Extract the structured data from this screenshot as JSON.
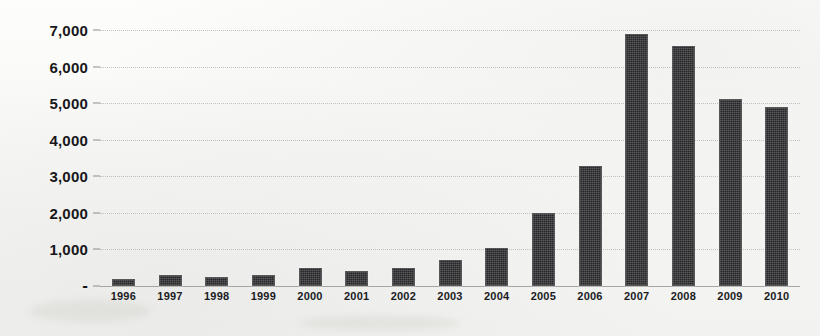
{
  "chart_data": {
    "type": "bar",
    "title": "",
    "subtitle": "",
    "xlabel": "",
    "ylabel": "",
    "categories": [
      "1996",
      "1997",
      "1998",
      "1999",
      "2000",
      "2001",
      "2002",
      "2003",
      "2004",
      "2005",
      "2006",
      "2007",
      "2008",
      "2009",
      "2010"
    ],
    "values": [
      200,
      300,
      250,
      300,
      500,
      420,
      490,
      700,
      1030,
      2000,
      3280,
      6900,
      6550,
      5120,
      4900
    ],
    "series": [
      {
        "name": "",
        "values": [
          200,
          300,
          250,
          300,
          500,
          420,
          490,
          700,
          1030,
          2000,
          3280,
          6900,
          6550,
          5120,
          4900
        ]
      }
    ],
    "ylim": [
      0,
      7000
    ],
    "y_ticks": [
      0,
      1000,
      2000,
      3000,
      4000,
      5000,
      6000,
      7000
    ],
    "y_tick_labels": [
      "-",
      "1,000",
      "2,000",
      "3,000",
      "4,000",
      "5,000",
      "6,000",
      "7,000"
    ],
    "grid": true,
    "grid_axis": "y",
    "legend": false,
    "legend_position": "none",
    "bar_color": "#262628",
    "grid_color": "#b9b9b6",
    "background_color": "#f7f7f5",
    "text_color": "#17171a"
  }
}
